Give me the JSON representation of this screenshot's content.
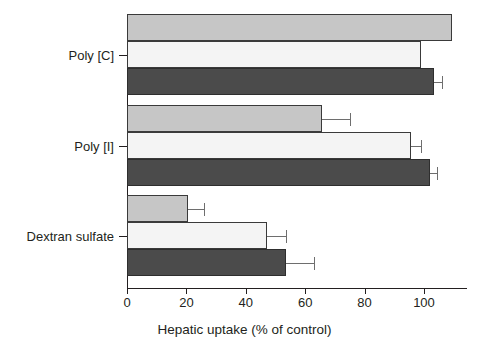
{
  "chart_data": {
    "type": "bar",
    "orientation": "horizontal",
    "title": "",
    "xlabel": "Hepatic uptake (% of control)",
    "ylabel": "",
    "categories": [
      "Poly [C]",
      "Poly [I]",
      "Dextran sulfate"
    ],
    "xlim": [
      0,
      114
    ],
    "xticks": [
      0,
      20,
      40,
      60,
      80,
      100
    ],
    "xticklabels": [
      "0",
      "20",
      "40",
      "60",
      "80",
      "100"
    ],
    "grid": false,
    "legend": "none",
    "series": [
      {
        "name": "series-1",
        "color": "#c6c6c6",
        "values": [
          109.5,
          65.5,
          20.5
        ],
        "errors": [
          0,
          9.5,
          5.5
        ]
      },
      {
        "name": "series-2",
        "color": "#f4f4f4",
        "values": [
          99.0,
          95.5,
          47.0
        ],
        "errors": [
          0,
          3.5,
          6.5
        ]
      },
      {
        "name": "series-3",
        "color": "#4b4b4b",
        "values": [
          103.5,
          102.0,
          53.5
        ],
        "errors": [
          2.5,
          2.5,
          9.5
        ]
      }
    ]
  },
  "axis": {
    "x_title": "Hepatic uptake (% of control)"
  }
}
